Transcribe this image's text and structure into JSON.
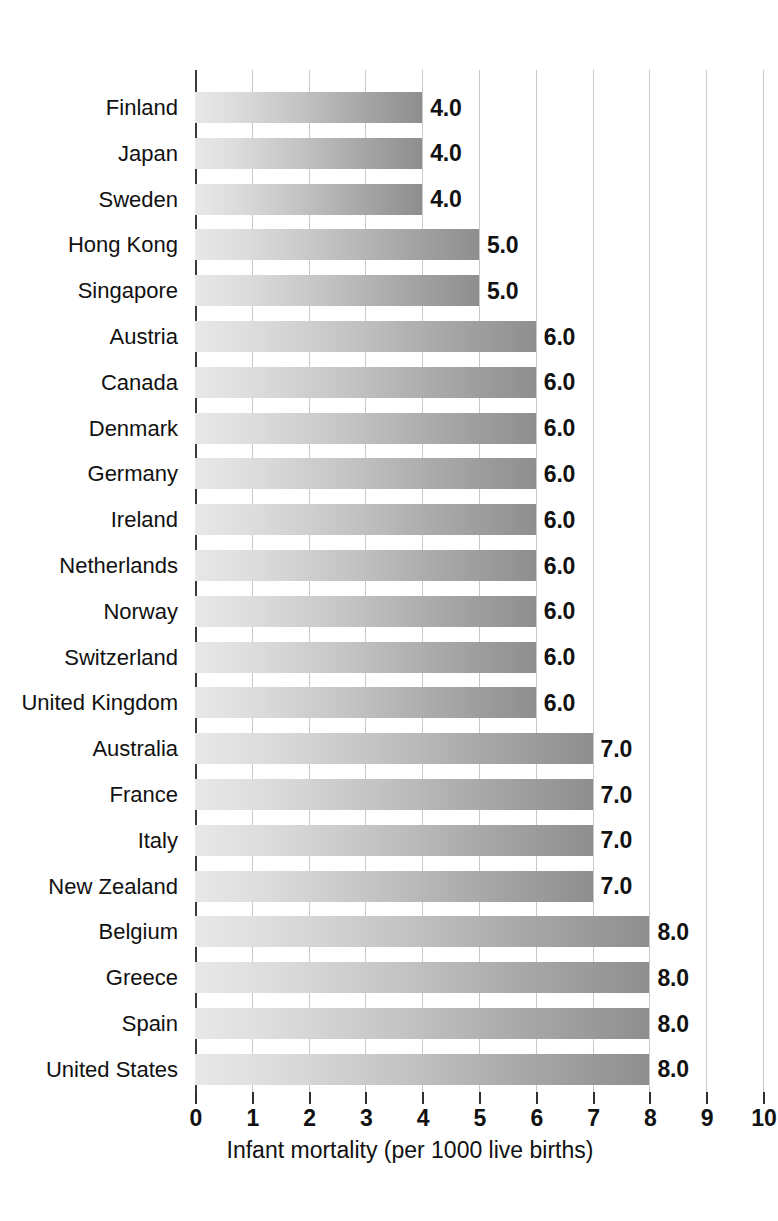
{
  "chart_data": {
    "type": "bar",
    "orientation": "horizontal",
    "title": "",
    "subtitle": "",
    "xlabel": "Infant mortality (per 1000 live births)",
    "ylabel": "",
    "xlim": [
      0,
      10
    ],
    "xticks": [
      0,
      1,
      2,
      3,
      4,
      5,
      6,
      7,
      8,
      9,
      10
    ],
    "xtick_labels": [
      "0",
      "1",
      "2",
      "3",
      "4",
      "5",
      "6",
      "7",
      "8",
      "9",
      "10"
    ],
    "grid": true,
    "grid_axis": "x",
    "legend": false,
    "legend_position": "none",
    "value_label_format": "one-decimal",
    "categories": [
      "Finland",
      "Japan",
      "Sweden",
      "Hong Kong",
      "Singapore",
      "Austria",
      "Canada",
      "Denmark",
      "Germany",
      "Ireland",
      "Netherlands",
      "Norway",
      "Switzerland",
      "United Kingdom",
      "Australia",
      "France",
      "Italy",
      "New Zealand",
      "Belgium",
      "Greece",
      "Spain",
      "United States"
    ],
    "values": [
      4.0,
      4.0,
      4.0,
      5.0,
      5.0,
      6.0,
      6.0,
      6.0,
      6.0,
      6.0,
      6.0,
      6.0,
      6.0,
      6.0,
      7.0,
      7.0,
      7.0,
      7.0,
      8.0,
      8.0,
      8.0,
      8.0
    ],
    "value_labels": [
      "4.0",
      "4.0",
      "4.0",
      "5.0",
      "5.0",
      "6.0",
      "6.0",
      "6.0",
      "6.0",
      "6.0",
      "6.0",
      "6.0",
      "6.0",
      "6.0",
      "7.0",
      "7.0",
      "7.0",
      "7.0",
      "8.0",
      "8.0",
      "8.0",
      "8.0"
    ],
    "bars": [
      {
        "category": "Finland",
        "value": 4.0,
        "label": "4.0"
      },
      {
        "category": "Japan",
        "value": 4.0,
        "label": "4.0"
      },
      {
        "category": "Sweden",
        "value": 4.0,
        "label": "4.0"
      },
      {
        "category": "Hong Kong",
        "value": 5.0,
        "label": "5.0"
      },
      {
        "category": "Singapore",
        "value": 5.0,
        "label": "5.0"
      },
      {
        "category": "Austria",
        "value": 6.0,
        "label": "6.0"
      },
      {
        "category": "Canada",
        "value": 6.0,
        "label": "6.0"
      },
      {
        "category": "Denmark",
        "value": 6.0,
        "label": "6.0"
      },
      {
        "category": "Germany",
        "value": 6.0,
        "label": "6.0"
      },
      {
        "category": "Ireland",
        "value": 6.0,
        "label": "6.0"
      },
      {
        "category": "Netherlands",
        "value": 6.0,
        "label": "6.0"
      },
      {
        "category": "Norway",
        "value": 6.0,
        "label": "6.0"
      },
      {
        "category": "Switzerland",
        "value": 6.0,
        "label": "6.0"
      },
      {
        "category": "United Kingdom",
        "value": 6.0,
        "label": "6.0"
      },
      {
        "category": "Australia",
        "value": 7.0,
        "label": "7.0"
      },
      {
        "category": "France",
        "value": 7.0,
        "label": "7.0"
      },
      {
        "category": "Italy",
        "value": 7.0,
        "label": "7.0"
      },
      {
        "category": "New Zealand",
        "value": 7.0,
        "label": "7.0"
      },
      {
        "category": "Belgium",
        "value": 8.0,
        "label": "8.0"
      },
      {
        "category": "Greece",
        "value": 8.0,
        "label": "8.0"
      },
      {
        "category": "Spain",
        "value": 8.0,
        "label": "8.0"
      },
      {
        "category": "United States",
        "value": 8.0,
        "label": "8.0"
      }
    ],
    "colors": {
      "bar_gradient_start": "#e8e8e8",
      "bar_gradient_end": "#8e8e8e",
      "gridline": "#c9c9c9",
      "axis": "#3b3b3b",
      "text": "#111111",
      "background": "#ffffff"
    }
  }
}
